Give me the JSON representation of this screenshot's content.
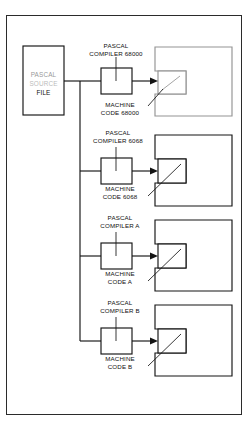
{
  "figure": {
    "source_box": {
      "line1": "PASCAL",
      "line2": "SOURCE",
      "line3": "FILE"
    },
    "groups": [
      {
        "compiler_line1": "PASCAL",
        "compiler_line2": "COMPILER 68000",
        "machine_line1": "MACHINE",
        "machine_line2": "CODE 68000",
        "target_label": "computer-outline"
      },
      {
        "compiler_line1": "PASCAL",
        "compiler_line2": "COMPILER 6068",
        "machine_line1": "MACHINE",
        "machine_line2": "CODE 6068",
        "target_label": "computer-outline"
      },
      {
        "compiler_line1": "PASCAL",
        "compiler_line2": "COMPILER A",
        "machine_line1": "MACHINE",
        "machine_line2": "CODE A",
        "target_label": "computer-outline"
      },
      {
        "compiler_line1": "PASCAL",
        "compiler_line2": "COMPILER B",
        "machine_line1": "MACHINE",
        "machine_line2": "CODE B",
        "target_label": "computer-outline"
      }
    ],
    "colors": {
      "ink": "#141414",
      "frame": "#2b2b2b",
      "paper": "#ffffff"
    }
  }
}
